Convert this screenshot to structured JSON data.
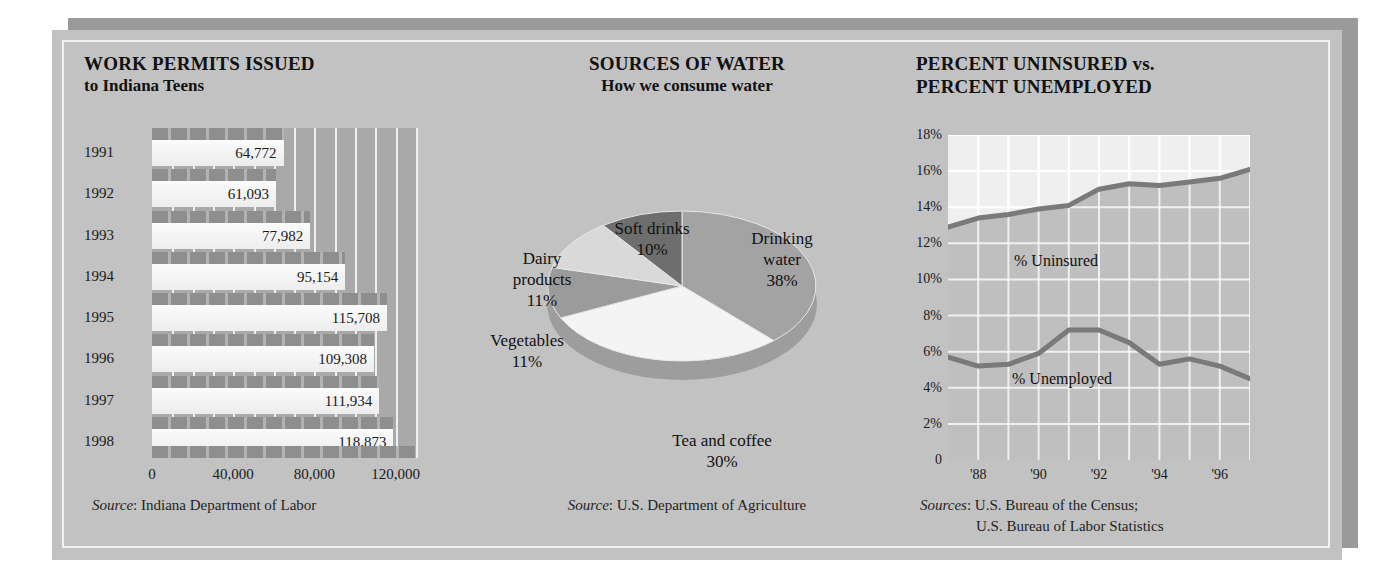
{
  "theme": {
    "page_bg": "#ffffff",
    "card_bg": "#c2c2c2",
    "card_shadow": "#9a9a9a",
    "inner_border": "#f2f2f2",
    "bar_plot_bg": "#a9a9a9",
    "bar_fill": "#fbfbfb",
    "bar_cap": "#8e8e8e",
    "line_plot_bg": "#efefef",
    "line_stroke": "#7a7a7a",
    "uninsured_area": "#b6b6b6",
    "text": "#1a1a1a"
  },
  "panels": {
    "bar": {
      "title": "WORK PERMITS ISSUED",
      "subtitle": "to Indiana Teens",
      "source_label": "Source",
      "source_text": ": Indiana Department of Labor"
    },
    "pie": {
      "title": "SOURCES OF WATER",
      "subtitle": "How we consume water",
      "source_label": "Source",
      "source_text": ": U.S. Department of Agriculture"
    },
    "line": {
      "title_line1": "PERCENT UNINSURED vs.",
      "title_line2": "PERCENT UNEMPLOYED",
      "source_label": "Sources",
      "source_text": ": U.S. Bureau of the Census;",
      "source_text2": "U.S. Bureau of Labor Statistics"
    }
  },
  "chart_data": [
    {
      "type": "bar",
      "orientation": "horizontal",
      "title": "WORK PERMITS ISSUED to Indiana Teens",
      "xlabel": "",
      "ylabel": "",
      "categories": [
        "1991",
        "1992",
        "1993",
        "1994",
        "1995",
        "1996",
        "1997",
        "1998"
      ],
      "values": [
        64772,
        61093,
        77982,
        95154,
        115708,
        109308,
        111934,
        118873
      ],
      "value_labels": [
        "64,772",
        "61,093",
        "77,982",
        "95,154",
        "115,708",
        "109,308",
        "111,934",
        "118,873"
      ],
      "xlim": [
        0,
        130000
      ],
      "xticks": [
        0,
        40000,
        80000,
        120000
      ],
      "xtick_labels": [
        "0",
        "40,000",
        "80,000",
        "120,000"
      ],
      "grid": true,
      "legend": "none"
    },
    {
      "type": "pie",
      "title": "SOURCES OF WATER — How we consume water",
      "labels": [
        "Drinking water",
        "Tea and coffee",
        "Vegetables",
        "Dairy products",
        "Soft drinks"
      ],
      "values": [
        38,
        30,
        11,
        11,
        10
      ],
      "value_labels": [
        "38%",
        "30%",
        "11%",
        "11%",
        "10%"
      ],
      "colors": [
        "#a3a3a3",
        "#f4f4f4",
        "#9b9b9b",
        "#d9d9d9",
        "#6e6e6e"
      ],
      "legend": "labels-around-pie",
      "three_d": true
    },
    {
      "type": "line",
      "title": "PERCENT UNINSURED vs. PERCENT UNEMPLOYED",
      "xlabel": "",
      "ylabel": "",
      "x": [
        1987,
        1988,
        1989,
        1990,
        1991,
        1992,
        1993,
        1994,
        1995,
        1996,
        1997
      ],
      "xticks": [
        1988,
        1990,
        1992,
        1994,
        1996
      ],
      "xtick_labels": [
        "'88",
        "'90",
        "'92",
        "'94",
        "'96"
      ],
      "ylim": [
        0,
        18
      ],
      "yticks": [
        0,
        2,
        4,
        6,
        8,
        10,
        12,
        14,
        16,
        18
      ],
      "ytick_labels": [
        "0",
        "2%",
        "4%",
        "6%",
        "8%",
        "10%",
        "12%",
        "14%",
        "16%",
        "18%"
      ],
      "grid": true,
      "legend": "inline-labels",
      "series": [
        {
          "name": "% Uninsured",
          "values": [
            12.9,
            13.4,
            13.6,
            13.9,
            14.1,
            15.0,
            15.3,
            15.2,
            15.4,
            15.6,
            16.1
          ]
        },
        {
          "name": "% Unemployed",
          "values": [
            5.7,
            5.2,
            5.3,
            5.9,
            7.2,
            7.2,
            6.5,
            5.3,
            5.6,
            5.2,
            4.5
          ]
        }
      ]
    }
  ]
}
